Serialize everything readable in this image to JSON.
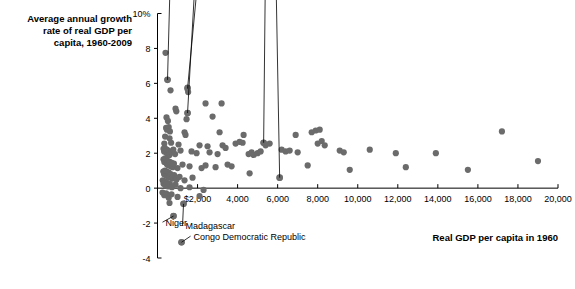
{
  "chart_data": {
    "type": "scatter",
    "title_lines": [
      "Average annual growth",
      "rate of real GDP per",
      "capita, 1960-2009"
    ],
    "xlabel": "Real GDP per capita in 1960",
    "ylabel": "Average annual growth rate of real GDP per capita, 1960-2009",
    "xlim": [
      0,
      20000
    ],
    "ylim": [
      -4,
      10
    ],
    "grid": false,
    "legend": null,
    "marker_color": "#6b6b6b",
    "axis_color": "#000000",
    "xticks": [
      2000,
      4000,
      6000,
      8000,
      10000,
      12000,
      14000,
      16000,
      18000,
      20000
    ],
    "xticklabels": [
      "$2,000",
      "4,000",
      "6,000",
      "8,000",
      "10,000",
      "12,000",
      "14,000",
      "16,000",
      "18,000",
      "20,000"
    ],
    "yticks": [
      10,
      8,
      6,
      4,
      2,
      0,
      -2,
      -4
    ],
    "yticklabels": [
      "10%",
      "8",
      "6",
      "4",
      "2",
      "0",
      "-2",
      "-4"
    ],
    "annotations": [
      {
        "label": "China",
        "x": 500,
        "y": 6.2,
        "label_x": 9.5,
        "label_y": 19.0
      },
      {
        "label": "South Korea",
        "x": 1500,
        "y": 5.7,
        "label_x": 32.0,
        "label_y": 24.5
      },
      {
        "label": "Malaysia",
        "x": 1500,
        "y": 4.3,
        "label_x": 30.0,
        "label_y": 31.5
      },
      {
        "label": "Israel",
        "x": 5300,
        "y": 2.6,
        "label_x": 58.0,
        "label_y": 41.0
      },
      {
        "label": "Venezuela",
        "x": 6100,
        "y": 0.6,
        "label_x": 53.0,
        "label_y": 60.0
      },
      {
        "label": "Niger",
        "x": 800,
        "y": -1.6,
        "label_x": 4.0,
        "label_y": -1.95
      },
      {
        "label": "Madagascar",
        "x": 1300,
        "y": -0.9,
        "label_x": 14.0,
        "label_y": -2.15
      },
      {
        "label": "Congo Democratic Republic",
        "x": 1200,
        "y": -3.1,
        "label_x": 18.0,
        "label_y": -2.75
      }
    ],
    "points": [
      {
        "x": 400,
        "y": 7.75
      },
      {
        "x": 500,
        "y": 6.2
      },
      {
        "x": 650,
        "y": 5.6
      },
      {
        "x": 1500,
        "y": 5.75
      },
      {
        "x": 1530,
        "y": 5.5
      },
      {
        "x": 2400,
        "y": 4.85
      },
      {
        "x": 3200,
        "y": 4.85
      },
      {
        "x": 900,
        "y": 4.55
      },
      {
        "x": 940,
        "y": 4.4
      },
      {
        "x": 1500,
        "y": 4.3
      },
      {
        "x": 450,
        "y": 4.05
      },
      {
        "x": 520,
        "y": 3.85
      },
      {
        "x": 1450,
        "y": 3.95
      },
      {
        "x": 2750,
        "y": 4.1
      },
      {
        "x": 430,
        "y": 3.45
      },
      {
        "x": 470,
        "y": 3.35
      },
      {
        "x": 560,
        "y": 3.5
      },
      {
        "x": 620,
        "y": 3.25
      },
      {
        "x": 1350,
        "y": 3.2
      },
      {
        "x": 1400,
        "y": 3.05
      },
      {
        "x": 3100,
        "y": 3.2
      },
      {
        "x": 4300,
        "y": 3.05
      },
      {
        "x": 6900,
        "y": 3.05
      },
      {
        "x": 7700,
        "y": 3.2
      },
      {
        "x": 7900,
        "y": 3.3
      },
      {
        "x": 8100,
        "y": 3.35
      },
      {
        "x": 17200,
        "y": 3.25
      },
      {
        "x": 380,
        "y": 2.95
      },
      {
        "x": 600,
        "y": 2.85
      },
      {
        "x": 680,
        "y": 2.6
      },
      {
        "x": 340,
        "y": 2.55
      },
      {
        "x": 1050,
        "y": 2.5
      },
      {
        "x": 2100,
        "y": 2.45
      },
      {
        "x": 2500,
        "y": 2.4
      },
      {
        "x": 3250,
        "y": 2.45
      },
      {
        "x": 3900,
        "y": 2.55
      },
      {
        "x": 4100,
        "y": 2.65
      },
      {
        "x": 4250,
        "y": 2.6
      },
      {
        "x": 5300,
        "y": 2.6
      },
      {
        "x": 5400,
        "y": 2.45
      },
      {
        "x": 5600,
        "y": 2.55
      },
      {
        "x": 8000,
        "y": 2.55
      },
      {
        "x": 8200,
        "y": 2.7
      },
      {
        "x": 8350,
        "y": 2.45
      },
      {
        "x": 300,
        "y": 2.25
      },
      {
        "x": 330,
        "y": 2.1
      },
      {
        "x": 360,
        "y": 2.3
      },
      {
        "x": 420,
        "y": 2.05
      },
      {
        "x": 460,
        "y": 2.2
      },
      {
        "x": 500,
        "y": 1.95
      },
      {
        "x": 540,
        "y": 2.15
      },
      {
        "x": 600,
        "y": 1.9
      },
      {
        "x": 700,
        "y": 2.05
      },
      {
        "x": 790,
        "y": 2.2
      },
      {
        "x": 880,
        "y": 1.95
      },
      {
        "x": 1150,
        "y": 2.15
      },
      {
        "x": 1700,
        "y": 2.1
      },
      {
        "x": 1950,
        "y": 2.0
      },
      {
        "x": 2600,
        "y": 2.05
      },
      {
        "x": 3000,
        "y": 1.95
      },
      {
        "x": 3400,
        "y": 2.3
      },
      {
        "x": 4550,
        "y": 1.95
      },
      {
        "x": 4700,
        "y": 2.05
      },
      {
        "x": 4800,
        "y": 1.9
      },
      {
        "x": 5000,
        "y": 2.0
      },
      {
        "x": 5150,
        "y": 2.1
      },
      {
        "x": 6200,
        "y": 2.2
      },
      {
        "x": 6400,
        "y": 2.1
      },
      {
        "x": 6600,
        "y": 2.15
      },
      {
        "x": 7000,
        "y": 2.05
      },
      {
        "x": 9100,
        "y": 2.15
      },
      {
        "x": 9300,
        "y": 2.05
      },
      {
        "x": 10600,
        "y": 2.2
      },
      {
        "x": 11900,
        "y": 2.0
      },
      {
        "x": 13900,
        "y": 2.0
      },
      {
        "x": 19000,
        "y": 1.55
      },
      {
        "x": 300,
        "y": 1.65
      },
      {
        "x": 340,
        "y": 1.5
      },
      {
        "x": 380,
        "y": 1.7
      },
      {
        "x": 420,
        "y": 1.45
      },
      {
        "x": 450,
        "y": 1.6
      },
      {
        "x": 480,
        "y": 1.35
      },
      {
        "x": 520,
        "y": 1.55
      },
      {
        "x": 560,
        "y": 1.3
      },
      {
        "x": 610,
        "y": 1.5
      },
      {
        "x": 660,
        "y": 1.25
      },
      {
        "x": 710,
        "y": 1.45
      },
      {
        "x": 760,
        "y": 1.2
      },
      {
        "x": 820,
        "y": 1.4
      },
      {
        "x": 1000,
        "y": 1.15
      },
      {
        "x": 1250,
        "y": 1.35
      },
      {
        "x": 1600,
        "y": 1.25
      },
      {
        "x": 2200,
        "y": 1.15
      },
      {
        "x": 2400,
        "y": 1.3
      },
      {
        "x": 2900,
        "y": 1.2
      },
      {
        "x": 3500,
        "y": 1.35
      },
      {
        "x": 3700,
        "y": 1.25
      },
      {
        "x": 4600,
        "y": 0.85
      },
      {
        "x": 7500,
        "y": 1.3
      },
      {
        "x": 9600,
        "y": 1.05
      },
      {
        "x": 12400,
        "y": 1.2
      },
      {
        "x": 15500,
        "y": 1.05
      },
      {
        "x": 290,
        "y": 0.95
      },
      {
        "x": 330,
        "y": 0.8
      },
      {
        "x": 370,
        "y": 1.0
      },
      {
        "x": 410,
        "y": 0.75
      },
      {
        "x": 450,
        "y": 0.95
      },
      {
        "x": 500,
        "y": 0.7
      },
      {
        "x": 550,
        "y": 0.9
      },
      {
        "x": 600,
        "y": 0.6
      },
      {
        "x": 660,
        "y": 0.8
      },
      {
        "x": 740,
        "y": 0.55
      },
      {
        "x": 830,
        "y": 0.75
      },
      {
        "x": 950,
        "y": 0.5
      },
      {
        "x": 1100,
        "y": 0.65
      },
      {
        "x": 1350,
        "y": 0.45
      },
      {
        "x": 1750,
        "y": 0.6
      },
      {
        "x": 6100,
        "y": 0.6
      },
      {
        "x": 260,
        "y": 0.45
      },
      {
        "x": 300,
        "y": 0.25
      },
      {
        "x": 350,
        "y": 0.4
      },
      {
        "x": 400,
        "y": 0.15
      },
      {
        "x": 460,
        "y": 0.3
      },
      {
        "x": 530,
        "y": 0.1
      },
      {
        "x": 620,
        "y": 0.25
      },
      {
        "x": 720,
        "y": 0.05
      },
      {
        "x": 900,
        "y": 0.2
      },
      {
        "x": 1150,
        "y": 0.0
      },
      {
        "x": 1600,
        "y": 0.05
      },
      {
        "x": 2300,
        "y": -0.1
      },
      {
        "x": 250,
        "y": -0.25
      },
      {
        "x": 340,
        "y": -0.4
      },
      {
        "x": 430,
        "y": -0.3
      },
      {
        "x": 560,
        "y": -0.55
      },
      {
        "x": 700,
        "y": -0.35
      },
      {
        "x": 1000,
        "y": -0.5
      },
      {
        "x": 1300,
        "y": -0.9
      },
      {
        "x": 2100,
        "y": -0.45
      },
      {
        "x": 600,
        "y": -0.85
      },
      {
        "x": 800,
        "y": -1.6
      },
      {
        "x": 1200,
        "y": -3.1
      }
    ]
  }
}
